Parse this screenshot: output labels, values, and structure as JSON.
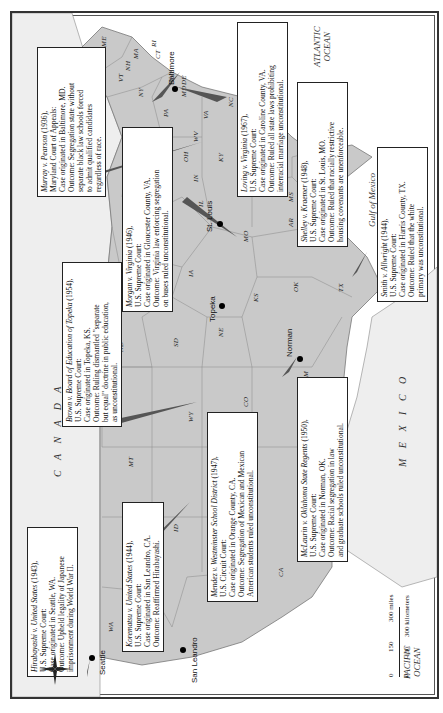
{
  "map": {
    "title_regions": {
      "canada": "C A N A D A",
      "mexico": "M E X I C O"
    },
    "oceans": {
      "atlantic": [
        "ATLANTIC",
        "OCEAN"
      ],
      "pacific": [
        "PACIFIC",
        "OCEAN"
      ],
      "gulf": "Gulf of Mexico"
    },
    "states": [
      "ME",
      "VT",
      "NH",
      "MA",
      "RI",
      "CT",
      "NY",
      "PA",
      "NJ",
      "MD",
      "DE",
      "VA",
      "WV",
      "OH",
      "MI",
      "IN",
      "IL",
      "KY",
      "TN",
      "NC",
      "SC",
      "GA",
      "AL",
      "MS",
      "FL",
      "LA",
      "AR",
      "MO",
      "IA",
      "WI",
      "MN",
      "ND",
      "SD",
      "NE",
      "KS",
      "OK",
      "TX",
      "NM",
      "CO",
      "WY",
      "MT",
      "ID",
      "UT",
      "AZ",
      "NV",
      "CA",
      "OR",
      "WA"
    ],
    "cities": [
      {
        "name": "Seattle"
      },
      {
        "name": "San Leandro"
      },
      {
        "name": "Topeka"
      },
      {
        "name": "Norman"
      },
      {
        "name": "St. Louis"
      },
      {
        "name": "Baltimore"
      }
    ],
    "cases": [
      {
        "id": "murray",
        "case": "Murray v. Pearson",
        "year": "(1936),",
        "court": "Maryland Court of Appeals:",
        "lines": [
          "Case originated in Baltimore, MD.",
          "Outcome: Segregation state without",
          "separate black law schools forced",
          "to admit qualified candidates",
          "regardless of race."
        ]
      },
      {
        "id": "morgan",
        "case": "Morgan v. Virginia",
        "year": "(1946),",
        "court": "U.S. Supreme Court:",
        "lines": [
          "Case originated in Gloucester County, VA.",
          "Outcome: Virginia law enforcing segregation",
          "on buses ruled unconstitutional."
        ]
      },
      {
        "id": "loving",
        "case": "Loving v. Virginia",
        "year": "(1967),",
        "court": "U.S. Supreme Court:",
        "lines": [
          "Case originated in Caroline County, VA.",
          "Outcome: Ruled all state laws prohibiting",
          "interracial marriage unconstitutional."
        ]
      },
      {
        "id": "shelley",
        "case": "Shelley v. Kraemer",
        "year": "(1948),",
        "court": "U.S. Supreme Court:",
        "lines": [
          "Case originated in St. Louis, MO.",
          "Outcome: Ruled that racially restrictive",
          "housing covenants are unenforceable."
        ]
      },
      {
        "id": "smith",
        "case": "Smith v. Allwright",
        "year": "(1944),",
        "court": "U.S. Supreme Court:",
        "lines": [
          "Case originated in Harris County, TX.",
          "Outcome: Ruled that the white",
          "primary was unconstitutional."
        ]
      },
      {
        "id": "brown",
        "case": "Brown v. Board of Education of Topeka",
        "year": "(1954),",
        "court": "U.S. Supreme Court:",
        "lines": [
          "Case originated in Topeka, KS.",
          "Outcome: Ruling dismantled \"separate",
          "but equal\" doctrine in public education,",
          "as unconstitutional."
        ]
      },
      {
        "id": "hirabayashi",
        "case": "Hirabayashi v. United States",
        "year": "(1943),",
        "court": "U.S. Supreme Court:",
        "lines": [
          "Case originated in Seattle, WA.",
          "Outcome: Upheld legality of Japanese",
          "imprisonment during World War II."
        ]
      },
      {
        "id": "korematsu",
        "case": "Korematsu v. United States",
        "year": "(1944),",
        "court": "U.S. Supreme Court:",
        "lines": [
          "Case originated in San Leandro, CA.",
          "Outcome: Reaffirmed Hirabayashi."
        ]
      },
      {
        "id": "mendez",
        "case": "Mendez v. Westminster School District",
        "year": "(1947),",
        "court": "U.S. Circuit Court:",
        "lines": [
          "Case originated in Orange County, CA.",
          "Outcome: Segregation of Mexican and Mexican",
          "American students ruled unconstitutional."
        ]
      },
      {
        "id": "mclaurin",
        "case": "McLaurin v. Oklahoma State Regents",
        "year": "(1950),",
        "court": "U.S. Supreme Court:",
        "lines": [
          "Case originated in Norman, OK.",
          "Outcome: Racial segregation in law",
          "and graduate schools ruled unconstitutional."
        ]
      }
    ],
    "scale": {
      "miles": [
        "0",
        "150",
        "300 miles"
      ],
      "km": [
        "0",
        "150",
        "300 kilometers"
      ]
    },
    "compass": {
      "n": "N",
      "s": "S",
      "e": "E",
      "w": "W"
    }
  }
}
